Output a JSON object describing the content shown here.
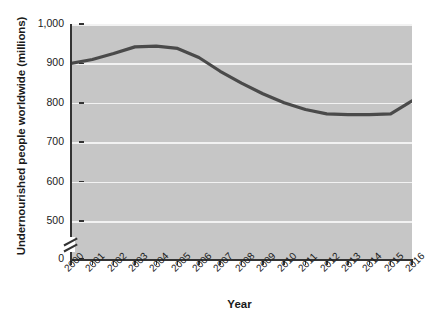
{
  "chart_data": {
    "type": "line",
    "title": "",
    "xlabel": "Year",
    "ylabel": "Undernourished people worldwide (millions)",
    "categories": [
      "2000",
      "2001",
      "2002",
      "2003",
      "2004",
      "2005",
      "2006",
      "2007",
      "2008",
      "2009",
      "2010",
      "2011",
      "2012",
      "2013",
      "2014",
      "2015",
      "2016"
    ],
    "values": [
      900,
      910,
      925,
      942,
      944,
      938,
      915,
      880,
      850,
      823,
      800,
      783,
      772,
      770,
      770,
      772,
      805
    ],
    "ylim": [
      500,
      1000
    ],
    "yticks": [
      0,
      500,
      600,
      700,
      800,
      900,
      1000
    ],
    "ytick_labels": [
      "0",
      "500",
      "600",
      "700",
      "800",
      "900",
      "1,000"
    ],
    "axis_break": true,
    "axis_break_between": [
      0,
      500
    ],
    "grid": true,
    "grid_axis": "y",
    "legend": "none",
    "series": [
      {
        "name": "Undernourished people worldwide",
        "values": [
          900,
          910,
          925,
          942,
          944,
          938,
          915,
          880,
          850,
          823,
          800,
          783,
          772,
          770,
          770,
          772,
          805
        ]
      }
    ],
    "colors": {
      "line": "#4a4a4a",
      "plot_background": "#c6c6c6",
      "gridline": "#f2f2f2",
      "axis": "#333333",
      "page_background": "#ffffff"
    }
  },
  "artifacts": {
    "watermark_line_1": "National Needs",
    "watermark_line_2": "Learning Goals"
  }
}
